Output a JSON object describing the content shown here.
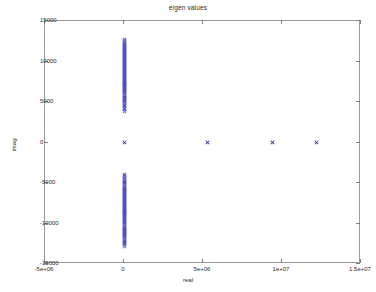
{
  "chart_data": {
    "type": "scatter",
    "title": "eigen values",
    "xlabel": "real",
    "ylabel": "imag",
    "xlim": [
      -5000000,
      15000000
    ],
    "ylim": [
      -15000,
      15000
    ],
    "xticks": [
      -5000000,
      0,
      5000000,
      10000000,
      15000000
    ],
    "xticklabels": [
      "-5e+06",
      "0",
      "5e+06",
      "1e+07",
      "1.5e+07"
    ],
    "yticks": [
      -15000,
      -10000,
      -5000,
      0,
      5000,
      10000,
      15000
    ],
    "yticklabels": [
      "-15000",
      "-10000",
      "-5000",
      "0",
      "5000",
      "10000",
      "15000"
    ],
    "grid": false,
    "legend": null,
    "marker": "x",
    "marker_color": "#2a2ab8",
    "series": [
      {
        "name": "eigenvalues",
        "description": "Complex-conjugate pairs clustered on the imaginary axis at real~0, plus four purely real eigenvalues.",
        "points": [
          [
            0,
            12700
          ],
          [
            0,
            12550
          ],
          [
            0,
            12400
          ],
          [
            0,
            12260
          ],
          [
            0,
            12120
          ],
          [
            0,
            11980
          ],
          [
            0,
            11850
          ],
          [
            0,
            11720
          ],
          [
            0,
            11590
          ],
          [
            0,
            11460
          ],
          [
            0,
            11330
          ],
          [
            0,
            11200
          ],
          [
            0,
            11080
          ],
          [
            0,
            10950
          ],
          [
            0,
            10830
          ],
          [
            0,
            10700
          ],
          [
            0,
            10580
          ],
          [
            0,
            10460
          ],
          [
            0,
            10340
          ],
          [
            0,
            10220
          ],
          [
            0,
            10100
          ],
          [
            0,
            9980
          ],
          [
            0,
            9860
          ],
          [
            0,
            9740
          ],
          [
            0,
            9620
          ],
          [
            0,
            9500
          ],
          [
            0,
            9380
          ],
          [
            0,
            9260
          ],
          [
            0,
            9140
          ],
          [
            0,
            9020
          ],
          [
            0,
            8900
          ],
          [
            0,
            8780
          ],
          [
            0,
            8660
          ],
          [
            0,
            8540
          ],
          [
            0,
            8420
          ],
          [
            0,
            8300
          ],
          [
            0,
            8180
          ],
          [
            0,
            8060
          ],
          [
            0,
            7940
          ],
          [
            0,
            7820
          ],
          [
            0,
            7700
          ],
          [
            0,
            7580
          ],
          [
            0,
            7460
          ],
          [
            0,
            7340
          ],
          [
            0,
            7220
          ],
          [
            0,
            7100
          ],
          [
            0,
            6980
          ],
          [
            0,
            6860
          ],
          [
            0,
            6740
          ],
          [
            0,
            6620
          ],
          [
            0,
            6500
          ],
          [
            0,
            6380
          ],
          [
            0,
            6250
          ],
          [
            0,
            6120
          ],
          [
            0,
            5990
          ],
          [
            0,
            5860
          ],
          [
            0,
            5730
          ],
          [
            0,
            5600
          ],
          [
            0,
            5460
          ],
          [
            0,
            5320
          ],
          [
            0,
            5180
          ],
          [
            0,
            5030
          ],
          [
            0,
            4880
          ],
          [
            0,
            4720
          ],
          [
            0,
            4560
          ],
          [
            0,
            4390
          ],
          [
            0,
            4210
          ],
          [
            0,
            4020
          ],
          [
            0,
            3820
          ],
          [
            0,
            0
          ],
          [
            0,
            -3900
          ],
          [
            0,
            -4100
          ],
          [
            0,
            -4290
          ],
          [
            0,
            -4470
          ],
          [
            0,
            -4640
          ],
          [
            0,
            -4800
          ],
          [
            0,
            -4950
          ],
          [
            0,
            -5100
          ],
          [
            0,
            -5240
          ],
          [
            0,
            -5380
          ],
          [
            0,
            -5520
          ],
          [
            0,
            -5650
          ],
          [
            0,
            -5780
          ],
          [
            0,
            -5910
          ],
          [
            0,
            -6040
          ],
          [
            0,
            -6170
          ],
          [
            0,
            -6300
          ],
          [
            0,
            -6420
          ],
          [
            0,
            -6540
          ],
          [
            0,
            -6660
          ],
          [
            0,
            -6780
          ],
          [
            0,
            -6900
          ],
          [
            0,
            -7020
          ],
          [
            0,
            -7140
          ],
          [
            0,
            -7260
          ],
          [
            0,
            -7380
          ],
          [
            0,
            -7500
          ],
          [
            0,
            -7620
          ],
          [
            0,
            -7740
          ],
          [
            0,
            -7860
          ],
          [
            0,
            -7980
          ],
          [
            0,
            -8100
          ],
          [
            0,
            -8220
          ],
          [
            0,
            -8340
          ],
          [
            0,
            -8460
          ],
          [
            0,
            -8580
          ],
          [
            0,
            -8700
          ],
          [
            0,
            -8820
          ],
          [
            0,
            -8940
          ],
          [
            0,
            -9060
          ],
          [
            0,
            -9180
          ],
          [
            0,
            -9300
          ],
          [
            0,
            -9420
          ],
          [
            0,
            -9540
          ],
          [
            0,
            -9660
          ],
          [
            0,
            -9790
          ],
          [
            0,
            -9920
          ],
          [
            0,
            -10050
          ],
          [
            0,
            -10180
          ],
          [
            0,
            -10310
          ],
          [
            0,
            -10440
          ],
          [
            0,
            -10570
          ],
          [
            0,
            -10700
          ],
          [
            0,
            -10830
          ],
          [
            0,
            -10960
          ],
          [
            0,
            -11090
          ],
          [
            0,
            -11220
          ],
          [
            0,
            -11360
          ],
          [
            0,
            -11500
          ],
          [
            0,
            -11640
          ],
          [
            0,
            -11780
          ],
          [
            0,
            -11920
          ],
          [
            0,
            -12060
          ],
          [
            0,
            -12200
          ],
          [
            0,
            -12350
          ],
          [
            0,
            -12500
          ],
          [
            0,
            -12650
          ],
          [
            0,
            -12800
          ],
          [
            5300000,
            0
          ],
          [
            9400000,
            0
          ],
          [
            12200000,
            0
          ]
        ]
      }
    ]
  }
}
